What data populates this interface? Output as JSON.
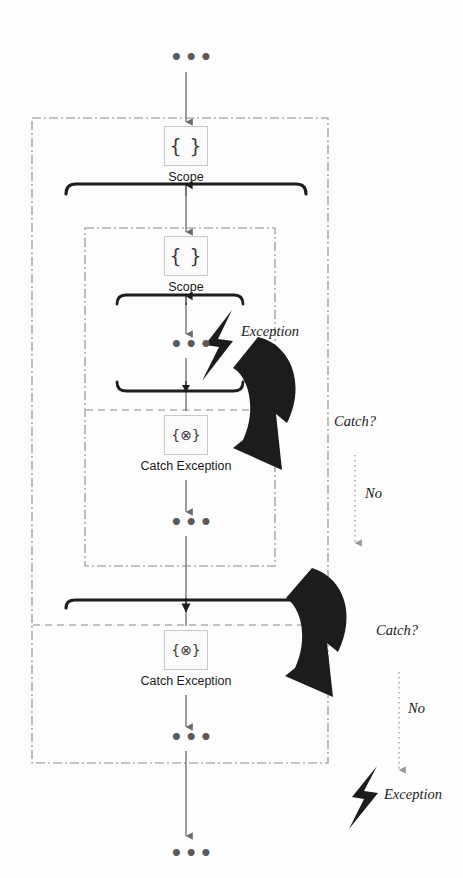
{
  "diagram": {
    "colors": {
      "ink": "#1a1a1a",
      "flow_line": "#6b6b6b",
      "bracket": "#1d1d1d",
      "boundary": "#8a8a8a",
      "node_border": "#c9c9c9",
      "node_fill": "#fbfbfb",
      "bolt": "#1c1c1c",
      "curved_arrow": "#1c1c1c",
      "dotted": "#9a9a9a"
    },
    "nodes": [
      {
        "id": "outer-scope",
        "icon": "scope-braces-icon",
        "glyph": "{ }",
        "label": "Scope"
      },
      {
        "id": "inner-scope",
        "icon": "scope-braces-icon",
        "glyph": "{ }",
        "label": "Scope"
      },
      {
        "id": "inner-catch",
        "icon": "catch-exception-icon",
        "glyph": "{⊗}",
        "label": "Catch Exception"
      },
      {
        "id": "outer-catch",
        "icon": "catch-exception-icon",
        "glyph": "{⊗}",
        "label": "Catch Exception"
      }
    ],
    "ellipsis_marker": "•••",
    "ellipses": [
      {
        "id": "flow-start",
        "text": "•••"
      },
      {
        "id": "inner-try-body",
        "text": "•••"
      },
      {
        "id": "inner-catch-body",
        "text": "•••"
      },
      {
        "id": "outer-catch-body",
        "text": "•••"
      },
      {
        "id": "flow-end",
        "text": "•••"
      }
    ],
    "annotations": [
      {
        "id": "inner-exception",
        "text": "Exception",
        "icon": "lightning-bolt-icon"
      },
      {
        "id": "inner-catch-question",
        "text": "Catch?"
      },
      {
        "id": "inner-catch-no",
        "text": "No"
      },
      {
        "id": "outer-catch-question",
        "text": "Catch?"
      },
      {
        "id": "outer-catch-no",
        "text": "No"
      },
      {
        "id": "escaped-exception",
        "text": "Exception",
        "icon": "lightning-bolt-icon"
      }
    ],
    "boundaries": [
      {
        "id": "outer-scope-boundary",
        "style": "dash-dot"
      },
      {
        "id": "inner-scope-boundary",
        "style": "dash-dot"
      },
      {
        "id": "inner-try-catch-divider",
        "style": "dashed"
      },
      {
        "id": "outer-try-catch-divider",
        "style": "dashed"
      }
    ]
  }
}
